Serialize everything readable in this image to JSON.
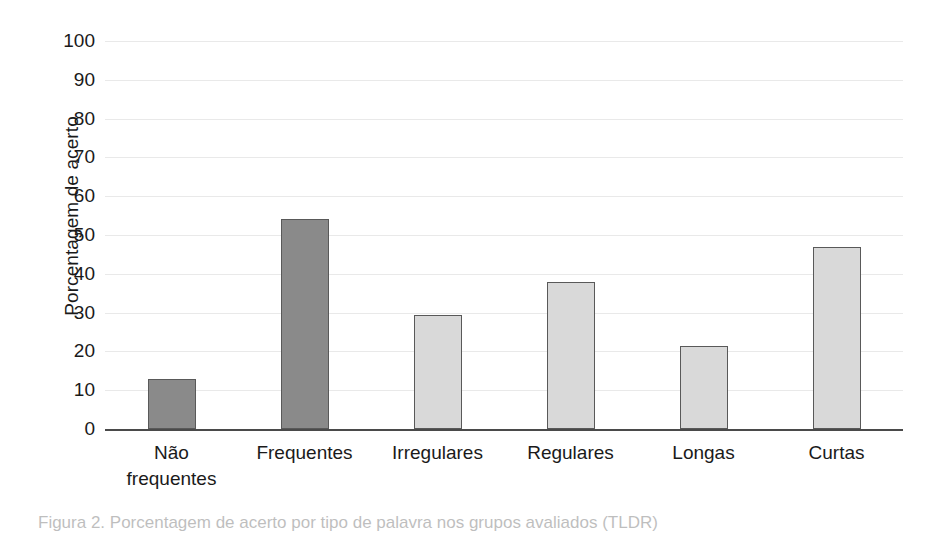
{
  "chart_data": {
    "type": "bar",
    "title": "",
    "xlabel": "",
    "ylabel": "Porcentagem de acerto",
    "categories": [
      "Não frequentes",
      "Frequentes",
      "Irregulares",
      "Regulares",
      "Longas",
      "Curtas"
    ],
    "category_lines": [
      [
        "Não",
        "frequentes"
      ],
      [
        "Frequentes"
      ],
      [
        "Irregulares"
      ],
      [
        "Regulares"
      ],
      [
        "Longas"
      ],
      [
        "Curtas"
      ]
    ],
    "values": [
      12.8,
      54.2,
      29.5,
      38.0,
      21.5,
      47.0
    ],
    "ylim": [
      0,
      100
    ],
    "yticks": [
      0,
      10,
      20,
      30,
      40,
      50,
      60,
      70,
      80,
      90,
      100
    ],
    "ytick_labels": [
      "0",
      "10",
      "20",
      "30",
      "40",
      "50",
      "60",
      "70",
      "80",
      "90",
      "100"
    ],
    "grid": true,
    "legend": "none",
    "bar_colors": [
      "#8a8a8a",
      "#8a8a8a",
      "#d9d9d9",
      "#d9d9d9",
      "#d9d9d9",
      "#d9d9d9"
    ],
    "bar_border_color": "#595959",
    "gridline_color": "#e9e9e9",
    "axis_color": "#4a4a4a"
  },
  "caption": {
    "text": "Figura 2. Porcentagem de acerto por tipo de palavra nos grupos avaliados (TLDR)"
  }
}
